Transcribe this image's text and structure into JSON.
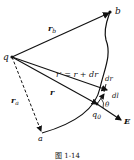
{
  "diagram": {
    "labels": {
      "point_q": "q",
      "point_b": "b",
      "point_a": "a",
      "vec_rb": "r",
      "vec_rb_sub": "b",
      "vec_ra": "r",
      "vec_ra_sub": "a",
      "vec_r": "r",
      "vec_rprime": "r′ = r + dr",
      "vec_dr": "dr",
      "vec_dl": "dl",
      "angle": "θ",
      "charge_q0": "q",
      "charge_q0_sub": "0",
      "field_E": "E"
    },
    "caption": "图 1-14"
  },
  "colors": {
    "ink": "#111111",
    "background": "#ffffff"
  }
}
